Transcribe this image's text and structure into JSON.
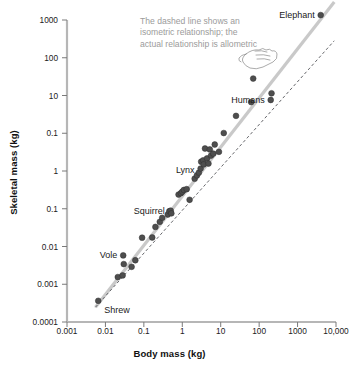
{
  "chart_data": {
    "type": "scatter",
    "title": "",
    "xlabel": "Body mass (kg)",
    "ylabel": "Skeletal mass (kg)",
    "xscale": "log",
    "yscale": "log",
    "xlim": [
      0.001,
      10000
    ],
    "ylim": [
      0.0001,
      1000
    ],
    "grid": false,
    "legend": "none",
    "xtick_labels": [
      "0.001",
      "0.01",
      "0.1",
      "1",
      "10",
      "100",
      "1000",
      "10,000"
    ],
    "xtick_values": [
      0.001,
      0.01,
      0.1,
      1,
      10,
      100,
      1000,
      10000
    ],
    "ytick_labels": [
      "1000",
      "100",
      "10",
      "0.1",
      "1",
      "0.1",
      "0.01",
      "0.001",
      "0.0001"
    ],
    "ytick_values": [
      1000,
      100,
      10,
      1,
      1,
      0.1,
      0.01,
      0.001,
      0.0001
    ],
    "annotation": "The dashed line shows an isometric relationship; the actual relationship is allometric",
    "annotation_color": "#9b9b9b",
    "point_color": "#4e4e4e",
    "allometric_line_color": "#c9c9c9",
    "isometric_line_color": "#55565a",
    "series": [
      {
        "name": "Mammal skeletal mass vs body mass",
        "points": [
          {
            "x": 0.0065,
            "y": 0.00031,
            "label": "Shrew",
            "label_pos": "right"
          },
          {
            "x": 0.021,
            "y": 0.0011,
            "label": "",
            "label_pos": ""
          },
          {
            "x": 0.028,
            "y": 0.0012,
            "label": "",
            "label_pos": ""
          },
          {
            "x": 0.029,
            "y": 0.0035,
            "label": "Vole",
            "label_pos": "left"
          },
          {
            "x": 0.03,
            "y": 0.0022,
            "label": "",
            "label_pos": ""
          },
          {
            "x": 0.048,
            "y": 0.0019,
            "label": "",
            "label_pos": ""
          },
          {
            "x": 0.06,
            "y": 0.0027,
            "label": "",
            "label_pos": ""
          },
          {
            "x": 0.09,
            "y": 0.009,
            "label": "",
            "label_pos": ""
          },
          {
            "x": 0.165,
            "y": 0.0091,
            "label": "",
            "label_pos": ""
          },
          {
            "x": 0.2,
            "y": 0.016,
            "label": "",
            "label_pos": ""
          },
          {
            "x": 0.26,
            "y": 0.021,
            "label": "",
            "label_pos": ""
          },
          {
            "x": 0.3,
            "y": 0.026,
            "label": "",
            "label_pos": ""
          },
          {
            "x": 0.42,
            "y": 0.031,
            "label": "",
            "label_pos": ""
          },
          {
            "x": 0.46,
            "y": 0.037,
            "label": "",
            "label_pos": ""
          },
          {
            "x": 0.5,
            "y": 0.038,
            "label": "Squirrel",
            "label_pos": "left"
          },
          {
            "x": 0.52,
            "y": 0.033,
            "label": "",
            "label_pos": ""
          },
          {
            "x": 0.8,
            "y": 0.09,
            "label": "",
            "label_pos": ""
          },
          {
            "x": 0.92,
            "y": 0.097,
            "label": "",
            "label_pos": ""
          },
          {
            "x": 1.0,
            "y": 0.105,
            "label": "",
            "label_pos": ""
          },
          {
            "x": 1.1,
            "y": 0.115,
            "label": "",
            "label_pos": ""
          },
          {
            "x": 1.3,
            "y": 0.12,
            "label": "",
            "label_pos": ""
          },
          {
            "x": 1.55,
            "y": 0.068,
            "label": "",
            "label_pos": ""
          },
          {
            "x": 2.1,
            "y": 0.21,
            "label": "",
            "label_pos": ""
          },
          {
            "x": 2.4,
            "y": 0.25,
            "label": "",
            "label_pos": ""
          },
          {
            "x": 2.7,
            "y": 0.29,
            "label": "",
            "label_pos": ""
          },
          {
            "x": 3.0,
            "y": 0.36,
            "label": "Lynx",
            "label_pos": "left"
          },
          {
            "x": 3.1,
            "y": 0.52,
            "label": "",
            "label_pos": ""
          },
          {
            "x": 3.5,
            "y": 0.56,
            "label": "",
            "label_pos": ""
          },
          {
            "x": 3.6,
            "y": 0.45,
            "label": "",
            "label_pos": ""
          },
          {
            "x": 3.9,
            "y": 1.05,
            "label": "",
            "label_pos": ""
          },
          {
            "x": 4.4,
            "y": 0.62,
            "label": "",
            "label_pos": ""
          },
          {
            "x": 4.8,
            "y": 0.47,
            "label": "",
            "label_pos": ""
          },
          {
            "x": 5.2,
            "y": 1.0,
            "label": "",
            "label_pos": ""
          },
          {
            "x": 5.6,
            "y": 0.72,
            "label": "",
            "label_pos": ""
          },
          {
            "x": 6.4,
            "y": 0.8,
            "label": "",
            "label_pos": ""
          },
          {
            "x": 7.0,
            "y": 1.3,
            "label": "",
            "label_pos": ""
          },
          {
            "x": 9.0,
            "y": 0.88,
            "label": "",
            "label_pos": ""
          },
          {
            "x": 12.0,
            "y": 2.4,
            "label": "",
            "label_pos": ""
          },
          {
            "x": 25.0,
            "y": 6.0,
            "label": "",
            "label_pos": ""
          },
          {
            "x": 62.0,
            "y": 12.5,
            "label": "",
            "label_pos": ""
          },
          {
            "x": 70.0,
            "y": 44.0,
            "label": "",
            "label_pos": ""
          },
          {
            "x": 200.0,
            "y": 14.0,
            "label": "Humans",
            "label_pos": "left"
          },
          {
            "x": 210.0,
            "y": 20.0,
            "label": "",
            "label_pos": ""
          },
          {
            "x": 4000.0,
            "y": 1300.0,
            "label": "Elephant",
            "label_pos": "left"
          }
        ]
      }
    ],
    "lines": [
      {
        "name": "allometric-trend",
        "style": "solid",
        "color": "#c9c9c9",
        "x1": 0.0055,
        "y1": 0.00022,
        "x2": 9000,
        "y2": 2600
      },
      {
        "name": "isometric-reference",
        "style": "dashed",
        "color": "#55565a",
        "x1": 0.0055,
        "y1": 0.00022,
        "x2": 9000,
        "y2": 330
      }
    ]
  }
}
